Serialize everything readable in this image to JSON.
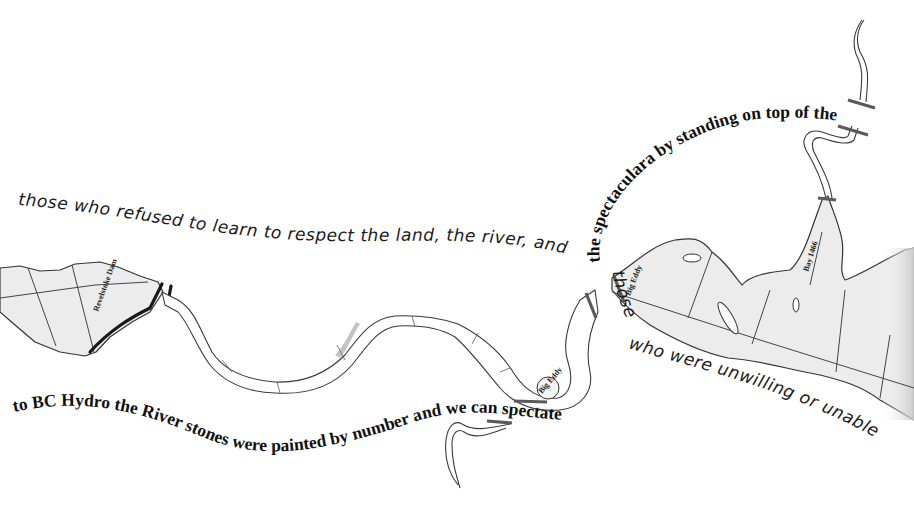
{
  "artwork": {
    "title": "Concrete poem over a map of the Columbia River (BC Hydro dams)",
    "handwritten_lines": {
      "line_top": "those who refused to learn to respect the land, the river, and",
      "line_bottom_right_start": "those",
      "line_bottom_right": "who were unwilling or unable"
    },
    "typeset_lines": {
      "arc_upper": "the spectaculara by standing on top of the",
      "wave_lower": "to BC Hydro the River stones were painted by number and we can spectate"
    },
    "map_labels": {
      "dam_left": "Revelstoke Dam",
      "eddy_lower": "Big Eddy",
      "eddy_upper": "Big Eddy",
      "right_inlet": "Bay 1466"
    },
    "colors": {
      "background": "#ffffff",
      "ink": "#111111",
      "reservoir_fill": "#ececec",
      "outline": "#3a3a3a",
      "marker_bars": "#5a5a5a"
    }
  }
}
